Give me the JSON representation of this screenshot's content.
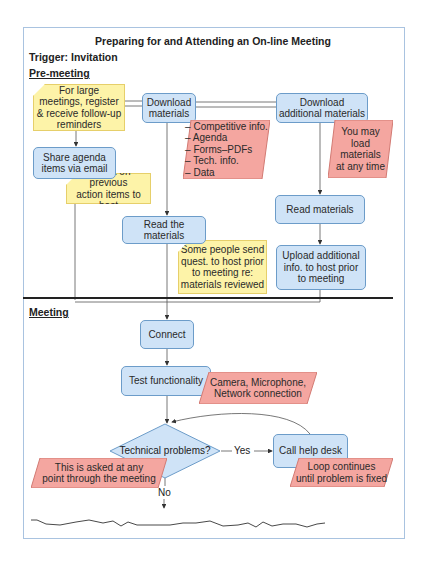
{
  "diagram": {
    "title": "Preparing for and Attending an On-line Meeting",
    "trigger": "Trigger: Invitation",
    "sections": {
      "pre_meeting": "Pre-meeting",
      "meeting": "Meeting"
    },
    "colors": {
      "process_fill": "#cfe3f7",
      "process_border": "#6c9cc9",
      "note_fill": "#fdf3a8",
      "data_fill": "#f4a6a0",
      "frame_border": "#a9c3e0"
    },
    "notes": {
      "register": [
        "For large",
        "meetings, register",
        "& receive follow-up",
        "reminders"
      ],
      "report_previous": [
        "Report on previous",
        "action items to host"
      ],
      "send_questions": [
        "Some people send",
        "quest. to host prior",
        "to meeting re:",
        "materials reviewed"
      ]
    },
    "processes": {
      "download_materials": [
        "Download",
        "materials"
      ],
      "download_additional": [
        "Download",
        "additional materials"
      ],
      "share_agenda": [
        "Share agenda",
        "items via email"
      ],
      "read_the_materials": "Read the materials",
      "read_materials": "Read materials",
      "upload_additional": [
        "Upload additional",
        "info. to host prior",
        "to meeting"
      ],
      "connect": "Connect",
      "test_functionality": "Test functionality",
      "call_help_desk": "Call help desk"
    },
    "data_items": {
      "materials_list": [
        "– Competitive info.",
        "– Agenda",
        "– Forms–PDFs",
        "– Tech. info.",
        "– Data"
      ],
      "load_any_time": [
        "You may",
        "load",
        "materials",
        "at any time"
      ],
      "test_items": [
        "Camera, Microphone,",
        "Network connection"
      ],
      "asked_any_point": [
        "This is asked at any",
        "point through the meeting"
      ],
      "loop_continues": [
        "Loop continues",
        "until problem is fixed"
      ]
    },
    "decision": {
      "question": "Technical problems?",
      "yes_label": "Yes",
      "no_label": "No"
    }
  }
}
